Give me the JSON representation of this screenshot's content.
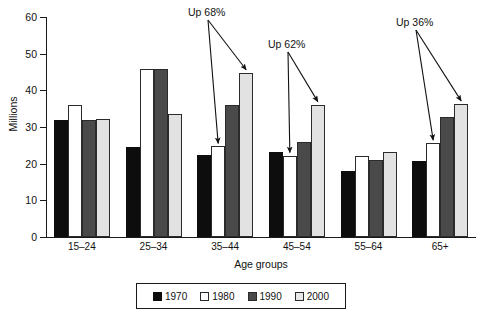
{
  "chart_data": {
    "type": "bar",
    "title": "",
    "xlabel": "Age groups",
    "ylabel": "Millions",
    "ylim": [
      0,
      60
    ],
    "yticks": [
      0,
      10,
      20,
      30,
      40,
      50,
      60
    ],
    "grid": false,
    "legend_position": "bottom",
    "categories": [
      "15–24",
      "25–34",
      "35–44",
      "45–54",
      "55–64",
      "65+"
    ],
    "series": [
      {
        "name": "1970",
        "color": "#0d0d0d",
        "values": [
          32.0,
          24.6,
          22.4,
          23.3,
          17.9,
          20.8
        ]
      },
      {
        "name": "1980",
        "color": "#ffffff",
        "values": [
          36.0,
          45.8,
          24.7,
          22.2,
          22.0,
          25.6
        ]
      },
      {
        "name": "1990",
        "color": "#4a4a4a",
        "values": [
          31.8,
          45.9,
          35.9,
          25.9,
          21.1,
          32.7
        ]
      },
      {
        "name": "2000",
        "color": "#e2e2e2",
        "values": [
          32.2,
          33.5,
          44.8,
          36.1,
          23.3,
          36.3
        ]
      }
    ],
    "annotations": [
      {
        "text": "Up 68%",
        "target_category": "35–44",
        "target_series": "2000"
      },
      {
        "text": "Up 62%",
        "target_category": "45–54",
        "target_series": "2000"
      },
      {
        "text": "Up 36%",
        "target_category": "65+",
        "target_series": "2000"
      }
    ]
  },
  "axis": {
    "ytick_labels": [
      "60",
      "50",
      "40",
      "30",
      "20",
      "10",
      "0"
    ],
    "ylabel": "Millions",
    "xlabel": "Age groups",
    "xtick_labels": [
      "15–24",
      "25–34",
      "35–44",
      "45–54",
      "55–64",
      "65+"
    ]
  },
  "annotations": {
    "a1": "Up 68%",
    "a2": "Up 62%",
    "a3": "Up 36%"
  },
  "legend": {
    "items": [
      {
        "label": "1970"
      },
      {
        "label": "1980"
      },
      {
        "label": "1990"
      },
      {
        "label": "2000"
      }
    ]
  }
}
